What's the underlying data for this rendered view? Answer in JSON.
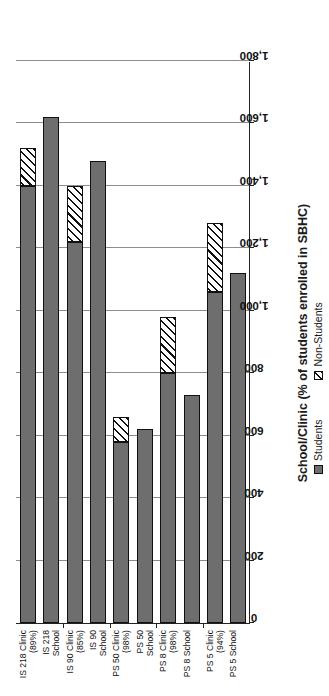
{
  "chart_data": {
    "type": "bar",
    "orientation": "horizontal-stacked",
    "title": "",
    "xlabel": "School/Clinic (% of students enrolled in SBHC)",
    "ylabel": "Number of Enrollees",
    "ylim": [
      0,
      1800
    ],
    "ytick_step": 200,
    "yticks": [
      "0",
      "200",
      "400",
      "600",
      "800",
      "1,000",
      "1,200",
      "1,400",
      "1,600",
      "1,800"
    ],
    "grid": true,
    "legend_position": "bottom",
    "categories": [
      {
        "line1": "PS 5 School",
        "line2": ""
      },
      {
        "line1": "PS 5 Clinic",
        "line2": "(94%)"
      },
      {
        "line1": "PS 8 School",
        "line2": ""
      },
      {
        "line1": "PS 8 Clinic",
        "line2": "(98%)"
      },
      {
        "line1": "PS 50",
        "line2": "School"
      },
      {
        "line1": "PS 50 Clinic",
        "line2": "(98%)"
      },
      {
        "line1": "IS 90",
        "line2": "School"
      },
      {
        "line1": "IS 90 Clinic",
        "line2": "(85%)"
      },
      {
        "line1": "IS 218",
        "line2": "School"
      },
      {
        "line1": "IS 218 Clinic",
        "line2": "(89%)"
      }
    ],
    "series": [
      {
        "name": "Students",
        "values": [
          1120,
          1060,
          730,
          800,
          620,
          580,
          1480,
          1220,
          1620,
          1400
        ]
      },
      {
        "name": "Non-Students",
        "values": [
          0,
          220,
          0,
          180,
          0,
          80,
          0,
          180,
          0,
          120
        ]
      }
    ]
  },
  "legend": {
    "items": [
      {
        "label": "Students",
        "pattern": "solid-gray"
      },
      {
        "label": "Non-Students",
        "pattern": "diagonal-hatch"
      }
    ]
  },
  "colors": {
    "students": "#6e6e6e",
    "nonstudents": "#ffffff",
    "axis": "#222222",
    "grid": "#8d8d8d",
    "background": "#ffffff"
  }
}
